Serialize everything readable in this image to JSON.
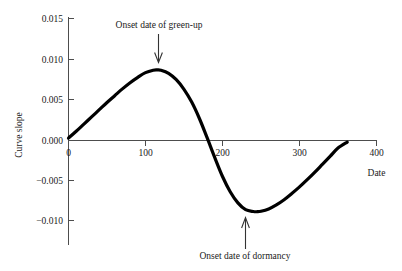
{
  "chart_data": {
    "type": "line",
    "title": "",
    "xlabel": "Date",
    "ylabel": "Curve slope",
    "xlim": [
      0,
      400
    ],
    "ylim": [
      -0.012,
      0.0155
    ],
    "grid": false,
    "legend": null,
    "x_ticks": [
      0,
      100,
      200,
      300,
      400
    ],
    "x_tick_labels": [
      "0",
      "100",
      "200",
      "300",
      "400"
    ],
    "y_ticks": [
      0.015,
      0.01,
      0.005,
      0.0,
      -0.005,
      -0.01
    ],
    "y_tick_labels": [
      "0.015",
      "0.010",
      "0.005",
      "0.000",
      "−0.005",
      "−0.010"
    ],
    "series": [
      {
        "name": "Curve slope",
        "color": "#000000",
        "x": [
          0,
          10,
          20,
          30,
          40,
          50,
          60,
          70,
          80,
          90,
          100,
          110,
          115,
          120,
          130,
          140,
          150,
          160,
          170,
          180,
          190,
          200,
          210,
          220,
          230,
          240,
          245,
          250,
          260,
          270,
          280,
          290,
          300,
          310,
          320,
          330,
          340,
          350,
          362
        ],
        "y": [
          0.0003,
          0.00115,
          0.00205,
          0.00295,
          0.00385,
          0.00475,
          0.0056,
          0.00645,
          0.00723,
          0.0079,
          0.00848,
          0.00878,
          0.00882,
          0.00878,
          0.0084,
          0.0076,
          0.0064,
          0.0048,
          0.00275,
          0.00035,
          -0.00215,
          -0.0045,
          -0.0064,
          -0.0078,
          -0.00865,
          -0.00888,
          -0.0089,
          -0.00885,
          -0.00855,
          -0.00805,
          -0.0074,
          -0.00663,
          -0.0058,
          -0.0049,
          -0.00395,
          -0.00295,
          -0.00195,
          -0.00095,
          -0.0002
        ]
      }
    ],
    "annotations": [
      {
        "text": "Onset date of green-up",
        "points_to_x": 117,
        "points_to_y": 0.0088,
        "arrow_direction": "down"
      },
      {
        "text": "Onset date of dormancy",
        "points_to_x": 245,
        "points_to_y": -0.0089,
        "arrow_direction": "up"
      }
    ]
  }
}
